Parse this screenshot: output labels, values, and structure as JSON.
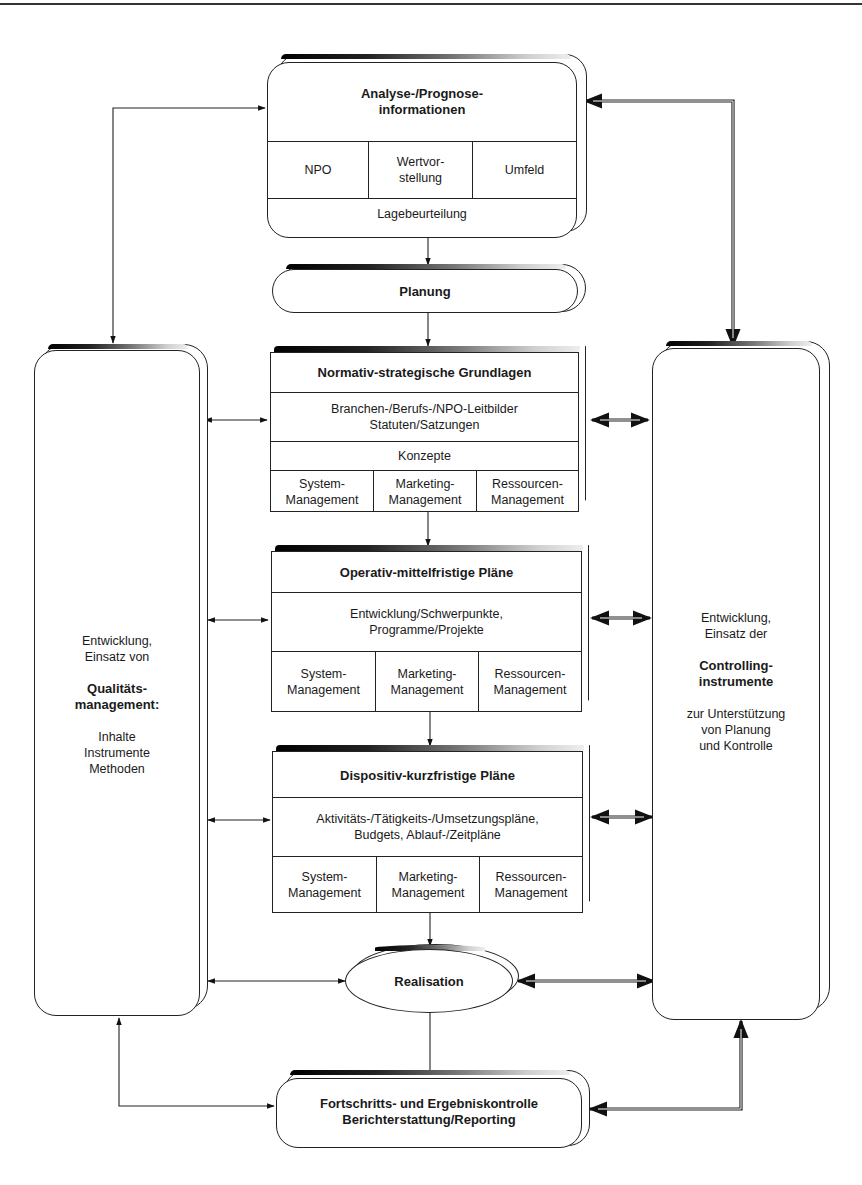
{
  "analysis": {
    "title_line1": "Analyse-/Prognose-",
    "title_line2": "informationen",
    "cells": [
      "NPO",
      "Wertvor-\nstellung",
      "Umfeld"
    ],
    "cell_npo": "NPO",
    "cell_wert_line1": "Wertvor-",
    "cell_wert_line2": "stellung",
    "cell_umfeld": "Umfeld",
    "footer": "Lagebeurteilung"
  },
  "planung": {
    "label": "Planung"
  },
  "normativ": {
    "title": "Normativ-strategische Grundlagen",
    "text_line1": "Branchen-/Berufs-/NPO-Leitbilder",
    "text_line2": "Statuten/Satzungen",
    "konzepte": "Konzepte",
    "cells": [
      {
        "line1": "System-",
        "line2": "Management"
      },
      {
        "line1": "Marketing-",
        "line2": "Management"
      },
      {
        "line1": "Ressourcen-",
        "line2": "Management"
      }
    ]
  },
  "operativ": {
    "title": "Operativ-mittelfristige Pläne",
    "text_line1": "Entwicklung/Schwerpunkte,",
    "text_line2": "Programme/Projekte",
    "cells": [
      {
        "line1": "System-",
        "line2": "Management"
      },
      {
        "line1": "Marketing-",
        "line2": "Management"
      },
      {
        "line1": "Ressourcen-",
        "line2": "Management"
      }
    ]
  },
  "dispositiv": {
    "title": "Dispositiv-kurzfristige Pläne",
    "text_line1": "Aktivitäts-/Tätigkeits-/Umsetzungspläne,",
    "text_line2": "Budgets, Ablauf-/Zeitpläne",
    "cells": [
      {
        "line1": "System-",
        "line2": "Management"
      },
      {
        "line1": "Marketing-",
        "line2": "Management"
      },
      {
        "line1": "Ressourcen-",
        "line2": "Management"
      }
    ]
  },
  "realisation": {
    "label": "Realisation"
  },
  "kontrolle": {
    "line1": "Fortschritts- und Ergebniskontrolle",
    "line2": "Berichterstattung/Reporting"
  },
  "quality_column": {
    "line1": "Entwicklung,",
    "line2": "Einsatz von",
    "bold1": "Qualitäts-",
    "bold2": "management:",
    "item1": "Inhalte",
    "item2": "Instrumente",
    "item3": "Methoden"
  },
  "controlling_column": {
    "line1": "Entwicklung,",
    "line2": "Einsatz der",
    "bold1": "Controlling-",
    "bold2": "instrumente",
    "sub1": "zur Unterstützung",
    "sub2": "von Planung",
    "sub3": "und Kontrolle"
  }
}
